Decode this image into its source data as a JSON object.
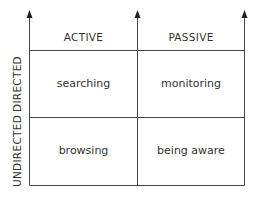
{
  "diagram": {
    "columns": [
      {
        "label": "ACTIVE"
      },
      {
        "label": "PASSIVE"
      }
    ],
    "rows": [
      {
        "label": "DIRECTED"
      },
      {
        "label": "UNDIRECTED"
      }
    ],
    "cells": [
      [
        "searching",
        "monitoring"
      ],
      [
        "browsing",
        "being aware"
      ]
    ],
    "line_color": "#444444",
    "text_color": "#333333"
  }
}
